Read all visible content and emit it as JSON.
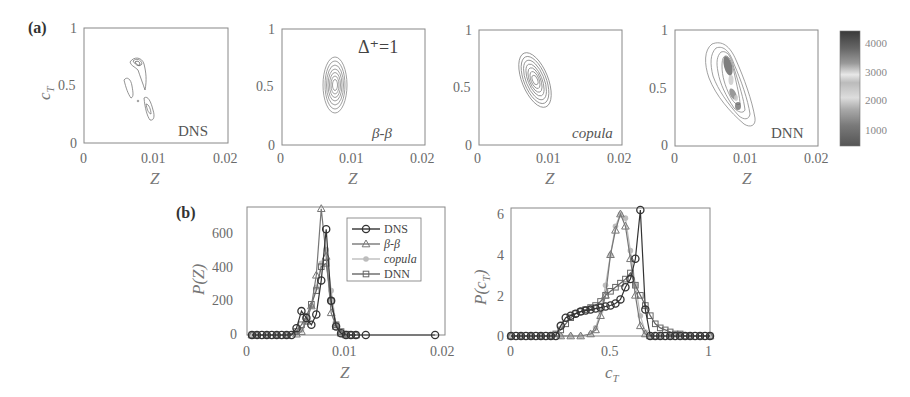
{
  "figure": {
    "panel_a_label": "(a)",
    "panel_b_label": "(b)",
    "delta_label": "Δ⁺=1",
    "contour_plots": [
      {
        "tag": "DNS",
        "tag_style": "normal",
        "xlabel": "Z",
        "ylabel": "c_T",
        "xticks": [
          "0",
          "0.01",
          "0.02"
        ],
        "yticks": [
          "0",
          "0.5",
          "1"
        ]
      },
      {
        "tag": "β-β",
        "tag_style": "italic",
        "xlabel": "Z",
        "ylabel": "",
        "xticks": [
          "0",
          "0.01",
          "0.02"
        ],
        "yticks": [
          "0",
          "0.5",
          "1"
        ]
      },
      {
        "tag": "copula",
        "tag_style": "italic",
        "xlabel": "Z",
        "ylabel": "",
        "xticks": [
          "0",
          "0.01",
          "0.02"
        ],
        "yticks": [
          "0",
          "0.5",
          "1"
        ]
      },
      {
        "tag": "DNN",
        "tag_style": "normal",
        "xlabel": "Z",
        "ylabel": "",
        "xticks": [
          "0",
          "0.01",
          "0.02"
        ],
        "yticks": [
          "0",
          "0.5",
          "1"
        ]
      }
    ],
    "colorbar": {
      "ticks": [
        "4000",
        "3000",
        "2000",
        "1000"
      ]
    },
    "legend": [
      "DNS",
      "β-β",
      "copula",
      "DNN"
    ]
  },
  "chart_data": [
    {
      "type": "heatmap",
      "title": "DNS joint PDF (Δ⁺=1)",
      "xlabel": "Z",
      "ylabel": "c_T",
      "xlim": [
        0,
        0.02
      ],
      "ylim": [
        0,
        1
      ],
      "description": "Irregular contours: a peak near (0.0075, 0.7), a streak around Z≈0.006–0.007, c_T≈0.4–0.55, and a lobe near (0.0095, 0.3)"
    },
    {
      "type": "heatmap",
      "title": "β-β joint PDF",
      "xlabel": "Z",
      "ylabel": "c_T",
      "xlim": [
        0,
        0.02
      ],
      "ylim": [
        0,
        1
      ],
      "description": "Upright elliptical contours centered at (0.0075, 0.53), c_T span ≈0.3–0.77"
    },
    {
      "type": "heatmap",
      "title": "copula joint PDF",
      "xlabel": "Z",
      "ylabel": "c_T",
      "xlim": [
        0,
        0.02
      ],
      "ylim": [
        0,
        1
      ],
      "description": "Tilted elliptical contours centered at (0.008, 0.57), negatively correlated"
    },
    {
      "type": "heatmap",
      "title": "DNN joint PDF",
      "xlabel": "Z",
      "ylabel": "c_T",
      "xlim": [
        0,
        0.02
      ],
      "ylim": [
        0,
        1
      ],
      "colorbar_range": [
        500,
        4500
      ],
      "colorbar_ticks": [
        1000,
        2000,
        3000,
        4000
      ],
      "description": "Elongated, tilted banana-shaped contours from (0.006, 0.85) to (0.011, 0.18), dark core near (0.008, 0.7)"
    },
    {
      "type": "line",
      "title": "P(Z)",
      "xlabel": "Z",
      "ylabel": "P(Z)",
      "xlim": [
        0,
        0.02
      ],
      "ylim": [
        0,
        750
      ],
      "xticks": [
        0,
        0.01,
        0.02
      ],
      "yticks": [
        0,
        200,
        400,
        600
      ],
      "legend_position": "upper right",
      "series": [
        {
          "name": "DNS",
          "marker": "circle",
          "x": [
            0.0005,
            0.001,
            0.0015,
            0.002,
            0.0025,
            0.003,
            0.0035,
            0.004,
            0.0045,
            0.005,
            0.0055,
            0.006,
            0.0065,
            0.007,
            0.0075,
            0.008,
            0.0085,
            0.009,
            0.0095,
            0.01,
            0.0105,
            0.011,
            0.012,
            0.019
          ],
          "y": [
            0,
            0,
            0,
            0,
            0,
            0,
            0,
            0,
            0,
            40,
            140,
            100,
            60,
            120,
            320,
            620,
            200,
            50,
            10,
            0,
            0,
            0,
            0,
            0
          ]
        },
        {
          "name": "β-β",
          "marker": "triangle",
          "x": [
            0.0005,
            0.001,
            0.002,
            0.003,
            0.004,
            0.005,
            0.0055,
            0.006,
            0.0065,
            0.007,
            0.0075,
            0.008,
            0.0085,
            0.009,
            0.0095,
            0.01,
            0.011
          ],
          "y": [
            0,
            0,
            0,
            0,
            0,
            5,
            20,
            80,
            170,
            350,
            740,
            460,
            130,
            50,
            10,
            0,
            0
          ]
        },
        {
          "name": "copula",
          "marker": "dot",
          "x": [
            0.0005,
            0.001,
            0.002,
            0.003,
            0.004,
            0.005,
            0.0055,
            0.006,
            0.0065,
            0.007,
            0.0075,
            0.008,
            0.0085,
            0.009,
            0.0095,
            0.01
          ],
          "y": [
            0,
            0,
            0,
            0,
            0,
            10,
            30,
            80,
            170,
            280,
            420,
            500,
            260,
            60,
            10,
            0
          ]
        },
        {
          "name": "DNN",
          "marker": "square",
          "x": [
            0.0005,
            0.001,
            0.002,
            0.003,
            0.004,
            0.005,
            0.0055,
            0.006,
            0.0065,
            0.007,
            0.0075,
            0.008,
            0.0085,
            0.009,
            0.0095,
            0.01,
            0.0105,
            0.011
          ],
          "y": [
            0,
            0,
            0,
            0,
            0,
            20,
            60,
            110,
            180,
            260,
            400,
            420,
            200,
            60,
            20,
            5,
            0,
            0
          ]
        }
      ]
    },
    {
      "type": "line",
      "title": "P(c_T)",
      "xlabel": "c_T",
      "ylabel": "P(c_T)",
      "xlim": [
        0,
        1
      ],
      "ylim": [
        0,
        6.2
      ],
      "xticks": [
        0,
        0.5,
        1
      ],
      "yticks": [
        0,
        2,
        4,
        6
      ],
      "series": [
        {
          "name": "DNS",
          "marker": "circle",
          "x": [
            0,
            0.025,
            0.05,
            0.075,
            0.1,
            0.125,
            0.15,
            0.175,
            0.2,
            0.225,
            0.25,
            0.275,
            0.3,
            0.325,
            0.35,
            0.375,
            0.4,
            0.425,
            0.45,
            0.475,
            0.5,
            0.525,
            0.55,
            0.575,
            0.6,
            0.625,
            0.65,
            0.675,
            0.7,
            0.725,
            0.75,
            0.775,
            0.8,
            0.825,
            0.85,
            0.875,
            0.9,
            0.925,
            0.95,
            0.975,
            1.0
          ],
          "y": [
            0,
            0,
            0,
            0,
            0,
            0,
            0,
            0,
            0,
            0,
            0.5,
            0.9,
            1.0,
            1.1,
            1.2,
            1.25,
            1.3,
            1.35,
            1.4,
            1.45,
            1.5,
            1.6,
            1.8,
            2.4,
            2.8,
            3.8,
            6.2,
            1.3,
            0,
            0,
            0,
            0,
            0,
            0,
            0,
            0,
            0,
            0,
            0,
            0,
            0
          ]
        },
        {
          "name": "β-β",
          "marker": "triangle",
          "x": [
            0,
            0.05,
            0.1,
            0.15,
            0.2,
            0.25,
            0.3,
            0.35,
            0.4,
            0.425,
            0.45,
            0.475,
            0.5,
            0.525,
            0.55,
            0.575,
            0.6,
            0.625,
            0.65,
            0.675,
            0.7,
            0.725,
            0.75,
            0.8,
            0.85,
            0.9,
            0.95,
            1.0
          ],
          "y": [
            0,
            0,
            0,
            0,
            0,
            0,
            0,
            0,
            0.1,
            0.3,
            1.0,
            2.0,
            4.0,
            5.2,
            6.0,
            5.4,
            3.8,
            2.0,
            0.5,
            0.1,
            0,
            0,
            0,
            0,
            0,
            0,
            0,
            0
          ]
        },
        {
          "name": "copula",
          "marker": "dot",
          "x": [
            0,
            0.05,
            0.1,
            0.15,
            0.2,
            0.25,
            0.3,
            0.35,
            0.4,
            0.425,
            0.45,
            0.475,
            0.5,
            0.525,
            0.55,
            0.575,
            0.6,
            0.625,
            0.65,
            0.675,
            0.7,
            0.75,
            0.8,
            0.9,
            1.0
          ],
          "y": [
            0,
            0,
            0,
            0,
            0,
            0,
            0,
            0,
            0.1,
            0.4,
            1.2,
            2.5,
            4.0,
            5.4,
            6.0,
            5.8,
            4.2,
            2.5,
            1.0,
            0.2,
            0,
            0,
            0,
            0,
            0
          ]
        },
        {
          "name": "DNN",
          "marker": "square",
          "x": [
            0,
            0.05,
            0.1,
            0.15,
            0.2,
            0.225,
            0.25,
            0.275,
            0.3,
            0.325,
            0.35,
            0.375,
            0.4,
            0.425,
            0.45,
            0.475,
            0.5,
            0.525,
            0.55,
            0.575,
            0.6,
            0.625,
            0.65,
            0.675,
            0.7,
            0.725,
            0.75,
            0.775,
            0.8,
            0.825,
            0.85,
            0.875,
            0.9,
            0.95,
            1.0
          ],
          "y": [
            0,
            0,
            0,
            0,
            0,
            0.1,
            0.3,
            0.6,
            0.9,
            1.1,
            1.2,
            1.3,
            1.4,
            1.5,
            1.7,
            2.0,
            2.2,
            2.4,
            2.6,
            2.8,
            3.1,
            2.5,
            2.0,
            1.5,
            1.0,
            0.6,
            0.4,
            0.3,
            0.2,
            0.1,
            0.1,
            0,
            0,
            0,
            0
          ]
        }
      ]
    }
  ]
}
